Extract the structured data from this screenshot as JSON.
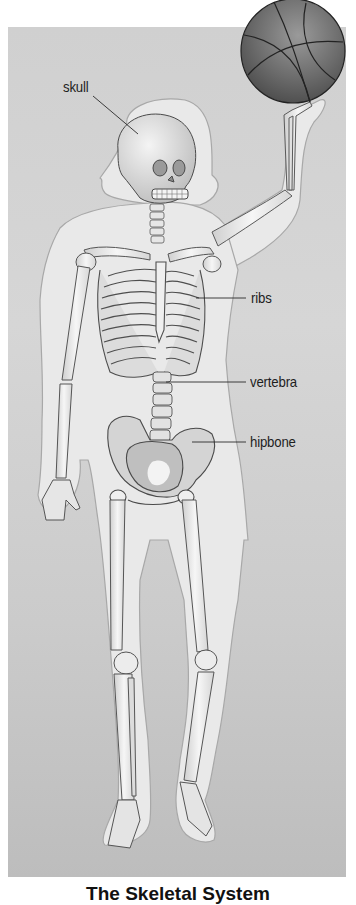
{
  "figure": {
    "caption": "The Skeletal System",
    "labels": [
      {
        "id": "skull",
        "text": "skull"
      },
      {
        "id": "ribs",
        "text": "ribs"
      },
      {
        "id": "vertebra",
        "text": "vertebra"
      },
      {
        "id": "hipbone",
        "text": "hipbone"
      }
    ],
    "objects": [
      "basketball",
      "body-outline",
      "skeleton"
    ],
    "colors": {
      "background": "#d0d0d0",
      "body": "#e8e8e8",
      "bone": "#f2f2f2",
      "outline": "#555555",
      "ball": "#6a6a6a"
    }
  }
}
